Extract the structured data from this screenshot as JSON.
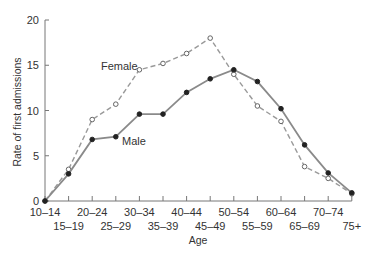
{
  "chart_data": {
    "type": "line",
    "title": "",
    "xlabel": "Age",
    "ylabel": "Rate of first admissions",
    "ylim": [
      0,
      20
    ],
    "yticks": [
      0,
      5,
      10,
      15,
      20
    ],
    "grid": false,
    "legend": "inline labels",
    "categories": [
      "10-14",
      "15-19",
      "20-24",
      "25-29",
      "30-34",
      "35-39",
      "40-44",
      "45-49",
      "50-54",
      "55-59",
      "60-64",
      "65-69",
      "70-74",
      "75+"
    ],
    "series": [
      {
        "name": "Female",
        "style": "dashed, open circles",
        "color": "#888888",
        "values": [
          0,
          3.5,
          9.0,
          10.7,
          14.5,
          15.2,
          16.3,
          18.0,
          14.0,
          10.5,
          8.8,
          3.8,
          2.5,
          0.8
        ]
      },
      {
        "name": "Male",
        "style": "solid, filled circles",
        "color": "#888888",
        "values": [
          0,
          3.0,
          6.8,
          7.1,
          9.6,
          9.6,
          12.0,
          13.5,
          14.5,
          13.2,
          10.2,
          6.2,
          3.1,
          0.9
        ]
      }
    ],
    "annotations": [
      {
        "text": "Female",
        "near": "25-29"
      },
      {
        "text": "Male",
        "near": "25-29"
      }
    ]
  }
}
